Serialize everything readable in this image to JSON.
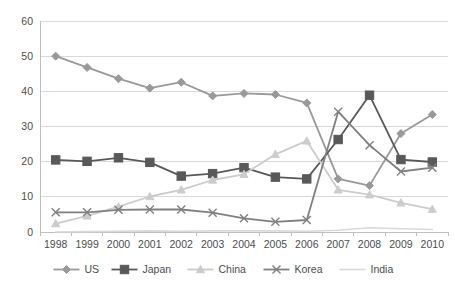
{
  "chart_data": {
    "type": "line",
    "title": "",
    "subtitle": "",
    "xlabel": "",
    "ylabel": "",
    "categories": [
      "1998",
      "1999",
      "2000",
      "2001",
      "2002",
      "2003",
      "2004",
      "2005",
      "2006",
      "2007",
      "2008",
      "2009",
      "2010"
    ],
    "ylim": [
      0,
      60
    ],
    "yticks": [
      0,
      10,
      20,
      30,
      40,
      50,
      60
    ],
    "ytick_labels": [
      "0",
      "10",
      "20",
      "30",
      "40",
      "50",
      "60"
    ],
    "grid": true,
    "legend_position": "bottom",
    "series": [
      {
        "name": "US",
        "marker": "diamond",
        "color": "#999999",
        "values": [
          50.0,
          46.8,
          43.6,
          40.9,
          42.6,
          38.7,
          39.4,
          39.1,
          36.7,
          15.1,
          13.2,
          28.0,
          33.4
        ]
      },
      {
        "name": "Japan",
        "marker": "square",
        "color": "#595959",
        "values": [
          20.5,
          20.1,
          21.1,
          19.8,
          15.9,
          16.6,
          18.3,
          15.6,
          15.1,
          26.3,
          38.9,
          20.6,
          19.9
        ]
      },
      {
        "name": "China",
        "marker": "triangle",
        "color": "#cccccc",
        "values": [
          2.4,
          4.6,
          7.2,
          10.1,
          12.0,
          14.8,
          16.4,
          22.1,
          25.9,
          12.0,
          10.6,
          8.3,
          6.5
        ]
      },
      {
        "name": "Korea",
        "marker": "cross",
        "color": "#808080",
        "values": [
          5.6,
          5.6,
          6.3,
          6.4,
          6.4,
          5.5,
          3.9,
          2.9,
          3.4,
          34.2,
          24.7,
          17.2,
          18.3
        ]
      },
      {
        "name": "India",
        "marker": "none",
        "color": "#d9d9d9",
        "values": [
          0.0,
          0.1,
          0.2,
          0.3,
          0.2,
          0.3,
          0.3,
          0.3,
          0.2,
          0.5,
          1.2,
          0.9,
          0.7
        ]
      }
    ]
  },
  "legend": {
    "items": [
      {
        "label": "US"
      },
      {
        "label": "Japan"
      },
      {
        "label": "China"
      },
      {
        "label": "Korea"
      },
      {
        "label": "India"
      }
    ]
  }
}
